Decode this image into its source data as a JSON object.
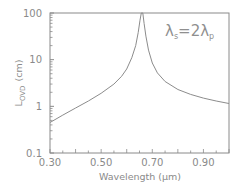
{
  "chart_data": {
    "type": "line",
    "title": "",
    "xlabel": "Wavelength (μm)",
    "ylabel": "L_OVD (cm)",
    "ylabel_main": "L",
    "ylabel_sub": "OVD",
    "ylabel_unit": "(cm)",
    "xlim": [
      0.3,
      1.0
    ],
    "ylim": [
      0.1,
      100
    ],
    "yscale": "log",
    "grid": false,
    "legend": null,
    "x_ticks": [
      "0.30",
      "0.50",
      "0.70",
      "0.90"
    ],
    "y_ticks": [
      "0.1",
      "1",
      "10",
      "100"
    ],
    "annotation": "λ_s = 2λ_p",
    "annotation_parts": {
      "lambda": "λ",
      "sub_s": "s",
      "eq": "=2",
      "sub_p": "p"
    },
    "series": [
      {
        "name": "L_OVD",
        "x": [
          0.3,
          0.35,
          0.4,
          0.45,
          0.5,
          0.55,
          0.58,
          0.6,
          0.62,
          0.635,
          0.645,
          0.652,
          0.657,
          0.66,
          0.663,
          0.668,
          0.675,
          0.685,
          0.7,
          0.72,
          0.75,
          0.8,
          0.85,
          0.9,
          0.95,
          1.0
        ],
        "y": [
          0.45,
          0.65,
          0.92,
          1.3,
          1.9,
          3.0,
          4.4,
          6.3,
          11,
          20,
          38,
          70,
          100,
          100,
          100,
          60,
          32,
          16,
          8.5,
          5.2,
          3.4,
          2.3,
          1.8,
          1.5,
          1.3,
          1.15
        ]
      }
    ],
    "peak_wavelength": 0.66,
    "colors": {
      "axis": "#8a8a8a",
      "line": "#8c8c8c",
      "text": "#8a8a8a"
    }
  }
}
